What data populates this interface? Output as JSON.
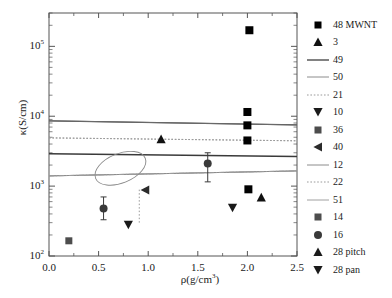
{
  "figure": {
    "background": "#ffffff"
  },
  "axes": {
    "x": {
      "label": "ρ(g/cm",
      "label_sup": "3",
      "label_tail": ")",
      "min": 0.0,
      "max": 2.5,
      "ticks": [
        "0.0",
        "0.5",
        "1.0",
        "1.5",
        "2.0",
        "2.5"
      ],
      "tick_values": [
        0.0,
        0.5,
        1.0,
        1.5,
        2.0,
        2.5
      ],
      "minor_per_interval": 1
    },
    "y": {
      "label": "κ(S/cm)",
      "scale": "log",
      "min": 100,
      "max": 300000,
      "ticks": [
        "10",
        "10",
        "10",
        "10"
      ],
      "tick_exponents": [
        "2",
        "3",
        "4",
        "5"
      ],
      "tick_values": [
        100,
        1000,
        10000,
        100000
      ]
    },
    "frame_color": "#555555",
    "text_color": "#1a1a1a"
  },
  "chart_data": {
    "type": "scatter",
    "title": "",
    "xlabel": "ρ(g/cm3)",
    "ylabel": "κ(S/cm)",
    "xlim": [
      0.0,
      2.5
    ],
    "ylim": [
      100,
      300000
    ],
    "yscale": "log",
    "xscale": "linear",
    "grid": false,
    "legend_position": "right",
    "series": [
      {
        "name": "48 MWNT",
        "label": "48 MWNT",
        "kind": "marker",
        "marker": "square",
        "color": "#000000",
        "size": 8,
        "points": [
          {
            "x": 2.02,
            "y": 170000
          },
          {
            "x": 2.0,
            "y": 11500
          },
          {
            "x": 2.0,
            "y": 7400
          },
          {
            "x": 2.0,
            "y": 4500
          },
          {
            "x": 2.01,
            "y": 900
          }
        ]
      },
      {
        "name": "3",
        "label": "3",
        "kind": "marker",
        "marker": "triangle-up",
        "color": "#111111",
        "size": 8,
        "points": [
          {
            "x": 1.13,
            "y": 4700
          },
          {
            "x": 2.14,
            "y": 690
          }
        ]
      },
      {
        "name": "49",
        "label": "49",
        "kind": "line",
        "linestyle": "solid",
        "color": "#4d4d4d",
        "width": 1.2,
        "y_left": 8600,
        "y_right": 7500
      },
      {
        "name": "50",
        "label": "50",
        "kind": "line",
        "linestyle": "solid",
        "color": "#8c8c8c",
        "width": 1.0,
        "y_left": 1400,
        "y_right": 1650
      },
      {
        "name": "21",
        "label": "21",
        "kind": "line",
        "linestyle": "dotted",
        "color": "#9a9a9a",
        "width": 1.0,
        "y_left": 4900,
        "y_right": 4450
      },
      {
        "name": "10",
        "label": "10",
        "kind": "marker",
        "marker": "triangle-down",
        "color": "#1a1a1a",
        "size": 8,
        "points": [
          {
            "x": 0.8,
            "y": 280
          },
          {
            "x": 1.85,
            "y": 490
          }
        ]
      },
      {
        "name": "36",
        "label": "36",
        "kind": "marker",
        "marker": "square",
        "color": "#4d4d4d",
        "size": 7,
        "points": [
          {
            "x": 0.2,
            "y": 165
          }
        ]
      },
      {
        "name": "40",
        "label": "40",
        "kind": "marker",
        "marker": "triangle-left",
        "color": "#2b2b2b",
        "size": 8,
        "points": [
          {
            "x": 0.97,
            "y": 880
          }
        ]
      },
      {
        "name": "12",
        "label": "12",
        "kind": "line",
        "linestyle": "solid",
        "color": "#6b6b6b",
        "width": 1.0,
        "y_left": 8600,
        "y_right": 7500
      },
      {
        "name": "22",
        "label": "22",
        "kind": "line",
        "linestyle": "dotted",
        "color": "#9a9a9a",
        "width": 1.0,
        "y_left": 4900,
        "y_right": 4450
      },
      {
        "name": "51",
        "label": "51",
        "kind": "line",
        "linestyle": "solid",
        "color": "#8c8c8c",
        "width": 1.0,
        "y_left": 1400,
        "y_right": 1650
      },
      {
        "name": "14",
        "label": "14",
        "kind": "marker",
        "marker": "square",
        "color": "#4d4d4d",
        "size": 7,
        "points": []
      },
      {
        "name": "16",
        "label": "16",
        "kind": "marker",
        "marker": "circle",
        "color": "#3a3a3a",
        "size": 8,
        "points": [
          {
            "x": 0.55,
            "y": 480,
            "yerr_low": 330,
            "yerr_high": 700
          },
          {
            "x": 1.6,
            "y": 2100,
            "yerr_low": 1150,
            "yerr_high": 3000
          }
        ]
      },
      {
        "name": "28 pitch",
        "label": "28 pitch",
        "kind": "marker",
        "marker": "triangle-up",
        "color": "#1a1a1a",
        "size": 8,
        "points": []
      },
      {
        "name": "28 pan",
        "label": "28 pan",
        "kind": "marker",
        "marker": "triangle-down",
        "color": "#1a1a1a",
        "size": 8,
        "points": []
      }
    ],
    "annotations": [
      {
        "type": "ellipse",
        "name": "highlight-ellipse",
        "cx": 0.72,
        "cy": 1800,
        "rx": 0.27,
        "ry_log": 0.21,
        "rotation_deg": -22,
        "color": "#8a8a8a"
      },
      {
        "type": "dotted-connector",
        "name": "dotted-connector-segment",
        "x": 0.91,
        "y_low": 300,
        "y_high": 900,
        "color": "#9a9a9a"
      }
    ]
  },
  "legend": {
    "entries": [
      {
        "label": "48 MWNT",
        "key": "square",
        "color": "#000000"
      },
      {
        "label": "3",
        "key": "triangle-up",
        "color": "#111111"
      },
      {
        "label": "49",
        "key": "line-solid",
        "color": "#4d4d4d"
      },
      {
        "label": "50",
        "key": "line-solid-light",
        "color": "#8c8c8c"
      },
      {
        "label": "21",
        "key": "line-dotted",
        "color": "#9a9a9a"
      },
      {
        "label": "10",
        "key": "triangle-down",
        "color": "#1a1a1a"
      },
      {
        "label": "36",
        "key": "square-gray",
        "color": "#4d4d4d"
      },
      {
        "label": "40",
        "key": "triangle-left",
        "color": "#2b2b2b"
      },
      {
        "label": "12",
        "key": "line-solid-light",
        "color": "#8c8c8c"
      },
      {
        "label": "22",
        "key": "line-dotted",
        "color": "#9a9a9a"
      },
      {
        "label": "51",
        "key": "line-solid-light",
        "color": "#a0a0a0"
      },
      {
        "label": "14",
        "key": "square-gray",
        "color": "#4d4d4d"
      },
      {
        "label": "16",
        "key": "circle",
        "color": "#3a3a3a"
      },
      {
        "label": "28 pitch",
        "key": "triangle-up",
        "color": "#1a1a1a"
      },
      {
        "label": "28 pan",
        "key": "triangle-down",
        "color": "#1a1a1a"
      }
    ]
  }
}
